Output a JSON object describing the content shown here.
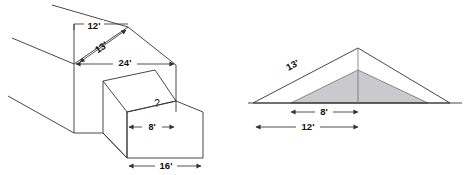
{
  "figure": {
    "background_color": "#ffffff",
    "stroke_color": "#333333",
    "shade_color": "#c9c9ce",
    "text_color": "#111111",
    "left_diagram": {
      "name": "house-isometric-view",
      "labels": {
        "rise": "12'",
        "slope": "13'",
        "span": "24'",
        "unknown": "?",
        "dormer_width": "8'",
        "base_width": "16'"
      }
    },
    "right_diagram": {
      "name": "roof-cross-section",
      "labels": {
        "slope": "13'",
        "inner_span": "8'",
        "outer_span": "12'"
      }
    }
  }
}
